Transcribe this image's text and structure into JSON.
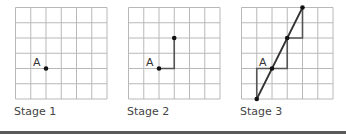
{
  "colors": {
    "grid": "#b8b8b8",
    "ink": "#333333",
    "path": "#555555",
    "rule": "#5a5a5a"
  },
  "grid": {
    "cols": 6,
    "rows": 6,
    "cell": 15.25
  },
  "stages": [
    {
      "label": "Stage 1",
      "origin_x": 15,
      "origin_y": 7,
      "point_label": "A",
      "point_label_at": [
        2,
        4
      ],
      "dots": [
        [
          2,
          4
        ]
      ],
      "steps": [],
      "diagonal": null
    },
    {
      "label": "Stage 2",
      "origin_x": 128,
      "origin_y": 7,
      "point_label": "A",
      "point_label_at": [
        2,
        4
      ],
      "dots": [
        [
          2,
          4
        ],
        [
          3,
          2
        ]
      ],
      "steps": [
        [
          [
            2,
            4
          ],
          [
            3,
            4
          ],
          [
            3,
            2
          ]
        ]
      ],
      "diagonal": null
    },
    {
      "label": "Stage 3",
      "origin_x": 241,
      "origin_y": 7,
      "point_label": "A",
      "point_label_at": [
        2,
        4
      ],
      "dots": [
        [
          1,
          6
        ],
        [
          2,
          4
        ],
        [
          3,
          2
        ],
        [
          4,
          0
        ]
      ],
      "steps": [
        [
          [
            1,
            6
          ],
          [
            1,
            4
          ],
          [
            3,
            4
          ],
          [
            3,
            2
          ],
          [
            4,
            2
          ],
          [
            4,
            0
          ]
        ]
      ],
      "diagonal": [
        [
          1,
          6
        ],
        [
          4,
          0
        ]
      ]
    }
  ]
}
